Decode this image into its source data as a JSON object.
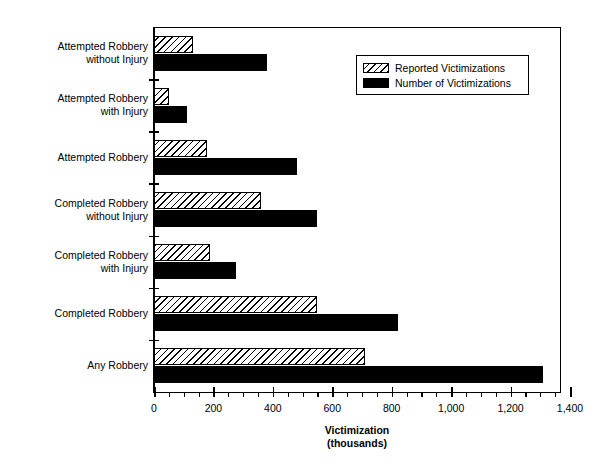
{
  "chart_data": {
    "type": "bar",
    "orientation": "horizontal",
    "title": "",
    "xlabel": "Victimization\n(thousands)",
    "ylabel": "",
    "xlim": [
      0,
      1400
    ],
    "xticks": [
      0,
      200,
      400,
      600,
      800,
      1000,
      1200,
      1400
    ],
    "xtick_labels": [
      "0",
      "200",
      "400",
      "600",
      "800",
      "1,000",
      "1,200",
      "1,400"
    ],
    "minor_tick_interval": 50,
    "grid": false,
    "legend_position": "upper right",
    "categories": [
      "Attempted Robbery\nwithout Injury",
      "Attempted Robbery\nwith Injury",
      "Attempted Robbery",
      "Completed Robbery\nwithout Injury",
      "Completed Robbery\nwith Injury",
      "Completed Robbery",
      "Any Robbery"
    ],
    "series": [
      {
        "name": "Reported Victimizations",
        "style": "hatched",
        "values": [
          130,
          50,
          180,
          360,
          190,
          550,
          710
        ]
      },
      {
        "name": "Number of Victimizations",
        "style": "solid-black",
        "values": [
          380,
          110,
          480,
          550,
          275,
          820,
          1310
        ]
      }
    ]
  },
  "legend": {
    "items": [
      {
        "label": "Reported Victimizations",
        "swatch": "hatched"
      },
      {
        "label": "Number of Victimizations",
        "swatch": "solid-black"
      }
    ]
  },
  "axis": {
    "x_title_line1": "Victimization",
    "x_title_line2": "(thousands)",
    "tick_labels": [
      "0",
      "200",
      "400",
      "600",
      "800",
      "1,000",
      "1,200",
      "1,400"
    ]
  },
  "colors": {
    "series_reported": "#ffffff",
    "series_number": "#000000",
    "axis": "#000000",
    "background": "#ffffff"
  }
}
